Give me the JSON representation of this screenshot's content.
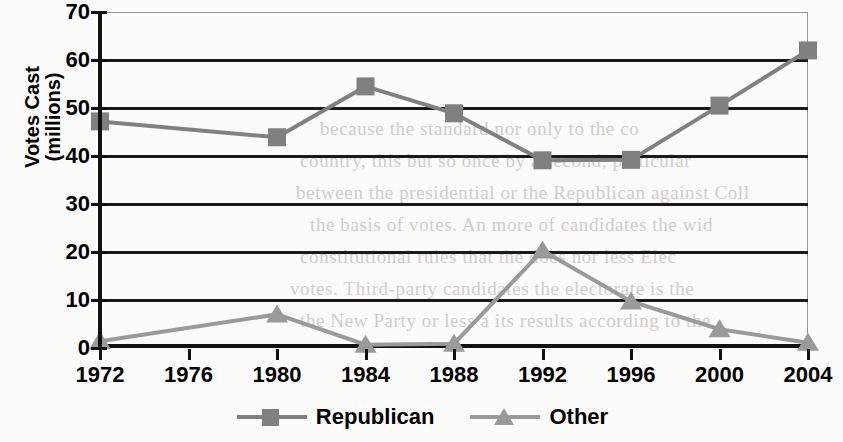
{
  "chart_data": {
    "type": "line",
    "title": "",
    "xlabel": "",
    "ylabel": "Votes Cast (millions)",
    "ylabel_line1": "Votes Cast",
    "ylabel_line2": "(millions)",
    "categories": [
      "1972",
      "1976",
      "1980",
      "1984",
      "1988",
      "1992",
      "1996",
      "2000",
      "2004"
    ],
    "ylim": [
      0,
      70
    ],
    "ytick_values": [
      0,
      10,
      20,
      30,
      40,
      50,
      60,
      70
    ],
    "ytick_labels": [
      "0",
      "10",
      "20",
      "30",
      "40",
      "50",
      "60",
      "70"
    ],
    "grid": true,
    "legend_position": "bottom",
    "series": [
      {
        "name": "Republican",
        "marker": "square",
        "color": "#808080",
        "values": [
          47.2,
          null,
          43.9,
          54.5,
          48.9,
          39.1,
          39.2,
          50.5,
          62.0
        ],
        "point_years": [
          "1972",
          "1980",
          "1984",
          "1988",
          "1992",
          "1996",
          "2000",
          "2004"
        ]
      },
      {
        "name": "Other",
        "marker": "triangle",
        "color": "#9a9a9a",
        "values": [
          1.4,
          null,
          7.0,
          0.7,
          0.9,
          20.3,
          9.7,
          3.9,
          1.1
        ],
        "point_years": [
          "1972",
          "1980",
          "1984",
          "1988",
          "1992",
          "1996",
          "2000",
          "2004"
        ]
      }
    ]
  },
  "legend": {
    "items": [
      {
        "label": "Republican",
        "marker": "square-marker-icon"
      },
      {
        "label": "Other",
        "marker": "triangle-marker-icon"
      }
    ]
  },
  "background_text": {
    "lines": [
      "because the standard nor only to the co",
      "country, this but so once by a second, particular",
      "between the presidential or the Republican against  Coll",
      "the basis of votes.  An more of candidates  the  wid",
      "constitutional rules that the  does nor  less  Elec",
      "votes. Third-party candidates  the electorate  is  the",
      "the New Party or less a its results according to the"
    ]
  }
}
